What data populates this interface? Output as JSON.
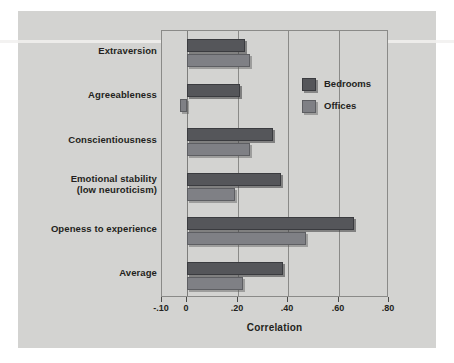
{
  "figure": {
    "top_caption": "",
    "background_color": "#d3d3d1",
    "panel_color": "#d3d3d1"
  },
  "legend": {
    "position": "inside-top-right",
    "entries": [
      {
        "label": "Bedrooms",
        "color": "#55565a"
      },
      {
        "label": "Offices",
        "color": "#7f8085"
      }
    ]
  },
  "chart_data": {
    "type": "bar",
    "orientation": "horizontal",
    "title": "",
    "subtitle": "",
    "xlabel": "Correlation",
    "ylabel": "",
    "xlim": [
      -0.1,
      0.8
    ],
    "grid": true,
    "grid_axis": "x",
    "xticks": [
      -0.1,
      0,
      0.2,
      0.4,
      0.6,
      0.8
    ],
    "xtick_labels": [
      "-.10",
      "0",
      ".20",
      ".40",
      ".60",
      ".80"
    ],
    "categories": [
      "Extraversion",
      "Agreeableness",
      "Conscientiousness",
      "Emotional stability\n(low neuroticism)",
      "Openess to experience",
      "Average"
    ],
    "category_lines": [
      [
        "Extraversion"
      ],
      [
        "Agreeableness"
      ],
      [
        "Conscientiousness"
      ],
      [
        "Emotional stability",
        "(low neuroticism)"
      ],
      [
        "Openess to experience"
      ],
      [
        "Average"
      ]
    ],
    "series": [
      {
        "name": "Bedrooms",
        "color": "#55565a",
        "values": [
          0.23,
          0.21,
          0.34,
          0.37,
          0.66,
          0.38
        ]
      },
      {
        "name": "Offices",
        "color": "#7f8085",
        "values": [
          0.25,
          -0.03,
          0.25,
          0.19,
          0.47,
          0.22
        ]
      }
    ]
  }
}
